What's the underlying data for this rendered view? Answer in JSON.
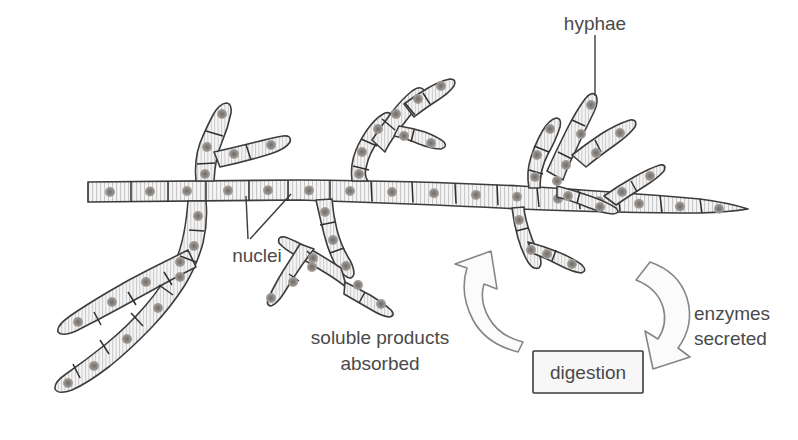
{
  "diagram": {
    "background_color": "#ffffff",
    "ink_color": "#3c3c3c",
    "hypha_fill": "#f2f2f2",
    "hatch_color": "#bdbdbd",
    "nucleus_color": "#8c8c8c",
    "label_color": "#4a4a4a"
  },
  "labels": {
    "hyphae": "hyphae",
    "nuclei": "nuclei",
    "soluble_line1": "soluble products",
    "soluble_line2": "absorbed",
    "enzymes_line1": "enzymes",
    "enzymes_line2": "secreted",
    "digestion": "digestion"
  },
  "cycle": {
    "left_arrow_name": "soluble products absorbed arrow",
    "left_arrow_direction": "up",
    "right_arrow_name": "enzymes secreted arrow",
    "right_arrow_direction": "down",
    "box_label": "digestion"
  }
}
